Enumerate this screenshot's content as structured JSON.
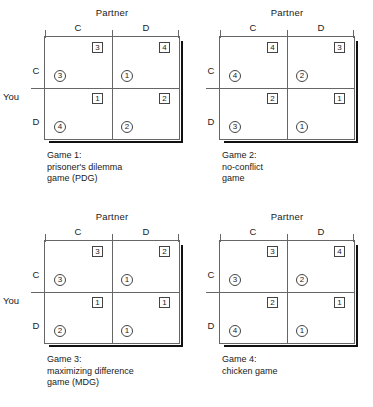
{
  "figure": {
    "column_player_label": "Partner",
    "row_player_label": "You",
    "column_headers": [
      "C",
      "D"
    ],
    "row_headers": [
      "C",
      "D"
    ]
  },
  "games": [
    {
      "id": "game-1",
      "caption": "Game 1:\nprisoner's dilemma\ngame (PDG)",
      "show_you_label": true,
      "cells": {
        "cc": {
          "partner": "3",
          "you": "3"
        },
        "cd": {
          "partner": "4",
          "you": "1"
        },
        "dc": {
          "partner": "1",
          "you": "4"
        },
        "dd": {
          "partner": "2",
          "you": "2"
        }
      }
    },
    {
      "id": "game-2",
      "caption": "Game 2:\nno-conflict\ngame",
      "show_you_label": false,
      "cells": {
        "cc": {
          "partner": "4",
          "you": "4"
        },
        "cd": {
          "partner": "3",
          "you": "2"
        },
        "dc": {
          "partner": "2",
          "you": "3"
        },
        "dd": {
          "partner": "1",
          "you": "1"
        }
      }
    },
    {
      "id": "game-3",
      "caption": "Game 3:\nmaximizing difference\ngame (MDG)",
      "show_you_label": true,
      "cells": {
        "cc": {
          "partner": "3",
          "you": "3"
        },
        "cd": {
          "partner": "2",
          "you": "1"
        },
        "dc": {
          "partner": "1",
          "you": "2"
        },
        "dd": {
          "partner": "1",
          "you": "1"
        }
      }
    },
    {
      "id": "game-4",
      "caption": "Game 4:\nchicken game",
      "show_you_label": false,
      "cells": {
        "cc": {
          "partner": "3",
          "you": "3"
        },
        "cd": {
          "partner": "4",
          "you": "2"
        },
        "dc": {
          "partner": "2",
          "you": "4"
        },
        "dd": {
          "partner": "1",
          "you": "1"
        }
      }
    }
  ],
  "chart_data": {
    "type": "table",
    "xlabel": "Partner",
    "ylabel": "You",
    "categories": [
      "C",
      "D"
    ],
    "notation": {
      "square": "Partner's payoff (upper right of cell)",
      "circle": "Your payoff (lower left of cell)"
    },
    "matrices": [
      {
        "name": "Game 1: prisoner's dilemma game (PDG)",
        "rows": [
          "C",
          "D"
        ],
        "cols": [
          "C",
          "D"
        ],
        "you": [
          [
            3,
            1
          ],
          [
            4,
            2
          ]
        ],
        "partner": [
          [
            3,
            4
          ],
          [
            1,
            2
          ]
        ]
      },
      {
        "name": "Game 2: no-conflict game",
        "rows": [
          "C",
          "D"
        ],
        "cols": [
          "C",
          "D"
        ],
        "you": [
          [
            4,
            2
          ],
          [
            3,
            1
          ]
        ],
        "partner": [
          [
            4,
            3
          ],
          [
            2,
            1
          ]
        ]
      },
      {
        "name": "Game 3: maximizing difference game (MDG)",
        "rows": [
          "C",
          "D"
        ],
        "cols": [
          "C",
          "D"
        ],
        "you": [
          [
            3,
            1
          ],
          [
            2,
            1
          ]
        ],
        "partner": [
          [
            3,
            2
          ],
          [
            1,
            1
          ]
        ]
      },
      {
        "name": "Game 4: chicken game",
        "rows": [
          "C",
          "D"
        ],
        "cols": [
          "C",
          "D"
        ],
        "you": [
          [
            3,
            2
          ],
          [
            4,
            1
          ]
        ],
        "partner": [
          [
            3,
            4
          ],
          [
            2,
            1
          ]
        ]
      }
    ]
  }
}
